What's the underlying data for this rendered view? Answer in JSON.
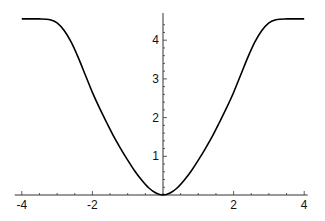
{
  "chart_data": {
    "type": "line",
    "title": "",
    "xlabel": "",
    "ylabel": "",
    "xlim": [
      -4.2,
      4.1
    ],
    "ylim": [
      0,
      4.65
    ],
    "grid": false,
    "legend": null,
    "x_ticks": [
      -4,
      -2,
      2,
      4
    ],
    "x_tick_labels": [
      "-4",
      "-2",
      "2",
      "4"
    ],
    "y_ticks": [
      1,
      2,
      3,
      4
    ],
    "y_tick_labels": [
      "1",
      "2",
      "3",
      "4"
    ],
    "series": [
      {
        "name": "curve",
        "color": "#000000",
        "x": [
          -4.0,
          -3.5,
          -3.2,
          -3.0,
          -2.8,
          -2.6,
          -2.4,
          -2.2,
          -2.0,
          -1.8,
          -1.6,
          -1.4,
          -1.2,
          -1.0,
          -0.8,
          -0.6,
          -0.4,
          -0.2,
          0.0,
          0.2,
          0.4,
          0.6,
          0.8,
          1.0,
          1.2,
          1.4,
          1.6,
          1.8,
          2.0,
          2.2,
          2.4,
          2.6,
          2.8,
          3.0,
          3.2,
          3.5,
          4.0
        ],
        "y": [
          4.55,
          4.55,
          4.53,
          4.45,
          4.25,
          3.95,
          3.55,
          3.1,
          2.65,
          2.25,
          1.88,
          1.52,
          1.2,
          0.9,
          0.62,
          0.38,
          0.18,
          0.05,
          0.0,
          0.05,
          0.18,
          0.38,
          0.62,
          0.9,
          1.2,
          1.52,
          1.88,
          2.25,
          2.65,
          3.1,
          3.55,
          3.95,
          4.25,
          4.45,
          4.53,
          4.55,
          4.55
        ]
      }
    ]
  }
}
